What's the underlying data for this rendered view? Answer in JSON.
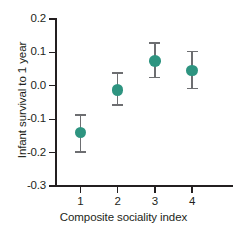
{
  "chart_data": {
    "type": "scatter",
    "title": "",
    "xlabel": "Composite sociality index",
    "ylabel": "Infant survival to 1 year",
    "x": [
      1,
      2,
      3,
      4
    ],
    "xtick_labels": [
      "1",
      "2",
      "3",
      "4"
    ],
    "ytick_labels": [
      "0.2",
      "0.1",
      "0.0",
      "-0.1",
      "-0.2",
      "-0.3"
    ],
    "ytick_values": [
      0.2,
      0.1,
      0.0,
      -0.1,
      -0.2,
      -0.3
    ],
    "xlim": [
      0.5,
      5.3
    ],
    "ylim": [
      -0.3,
      0.2
    ],
    "grid": false,
    "legend": null,
    "marker_color": "#2e9480",
    "errorbar_color": "#6d6e71",
    "axis_color": "#231f20",
    "series": [
      {
        "name": "Infant survival to 1 year",
        "values": [
          -0.14,
          -0.012,
          0.075,
          0.046
        ],
        "error_low": [
          -0.2,
          -0.06,
          0.022,
          -0.01
        ],
        "error_high": [
          -0.085,
          0.04,
          0.13,
          0.105
        ]
      }
    ],
    "points": [
      {
        "x": 1,
        "y": -0.14,
        "low": -0.2,
        "high": -0.085
      },
      {
        "x": 2,
        "y": -0.012,
        "low": -0.06,
        "high": 0.04
      },
      {
        "x": 3,
        "y": 0.075,
        "low": 0.022,
        "high": 0.13
      },
      {
        "x": 4,
        "y": 0.046,
        "low": -0.01,
        "high": 0.105
      }
    ]
  }
}
